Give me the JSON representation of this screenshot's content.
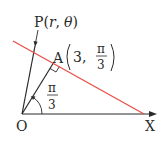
{
  "diagram": {
    "origin_label": "O",
    "axis_label": "X",
    "point_p": {
      "name": "P",
      "open": "(",
      "r": "r",
      "comma": ",",
      "theta": "θ",
      "close": ")"
    },
    "point_a": {
      "name": "A",
      "r": "3",
      "comma": ",",
      "angle_num": "π",
      "angle_den": "3"
    },
    "angle": {
      "num": "π",
      "den": "3"
    },
    "colors": {
      "line": "#e8524a",
      "ink": "#2a2a2a"
    }
  }
}
